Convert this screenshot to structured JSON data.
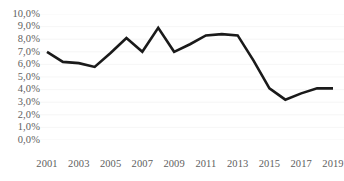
{
  "chart_data": {
    "type": "line",
    "title": "",
    "subtitle": "",
    "xlabel": "",
    "ylabel": "",
    "x": [
      2001,
      2002,
      2003,
      2004,
      2005,
      2006,
      2007,
      2008,
      2009,
      2010,
      2011,
      2012,
      2013,
      2014,
      2015,
      2016,
      2017,
      2018,
      2019
    ],
    "values": [
      7.0,
      6.2,
      6.1,
      5.8,
      6.9,
      8.1,
      7.0,
      8.9,
      7.0,
      7.6,
      8.3,
      8.4,
      8.3,
      6.3,
      4.1,
      3.2,
      3.7,
      4.1,
      4.1
    ],
    "series": [
      {
        "name": "",
        "values": [
          7.0,
          6.2,
          6.1,
          5.8,
          6.9,
          8.1,
          7.0,
          8.9,
          7.0,
          7.6,
          8.3,
          8.4,
          8.3,
          6.3,
          4.1,
          3.2,
          3.7,
          4.1,
          4.1
        ]
      }
    ],
    "xlim": [
      2001,
      2019
    ],
    "ylim": [
      0.0,
      10.0
    ],
    "grid": true,
    "legend": false,
    "legend_position": "none",
    "line_color": "#1a1a1a",
    "gridline_color": "#f2f2f2",
    "tick_label_color": "#5e5e5e",
    "background_color": "#ffffff",
    "y_ticks": [
      {
        "value": 10.0,
        "label": "10,0%"
      },
      {
        "value": 9.0,
        "label": "9,0%"
      },
      {
        "value": 8.0,
        "label": "8,0%"
      },
      {
        "value": 7.0,
        "label": "7,0%"
      },
      {
        "value": 6.0,
        "label": "6,0%"
      },
      {
        "value": 5.0,
        "label": "5,0%"
      },
      {
        "value": 4.0,
        "label": "4,0%"
      },
      {
        "value": 3.0,
        "label": "3,0%"
      },
      {
        "value": 2.0,
        "label": "2,0%"
      },
      {
        "value": 1.0,
        "label": "1,0%"
      },
      {
        "value": 0.0,
        "label": "0,0%"
      }
    ],
    "x_ticks": [
      {
        "value": 2001,
        "label": "2001"
      },
      {
        "value": 2003,
        "label": "2003"
      },
      {
        "value": 2005,
        "label": "2005"
      },
      {
        "value": 2007,
        "label": "2007"
      },
      {
        "value": 2009,
        "label": "2009"
      },
      {
        "value": 2011,
        "label": "2011"
      },
      {
        "value": 2013,
        "label": "2013"
      },
      {
        "value": 2015,
        "label": "2015"
      },
      {
        "value": 2017,
        "label": "2017"
      },
      {
        "value": 2019,
        "label": "2019"
      }
    ]
  }
}
